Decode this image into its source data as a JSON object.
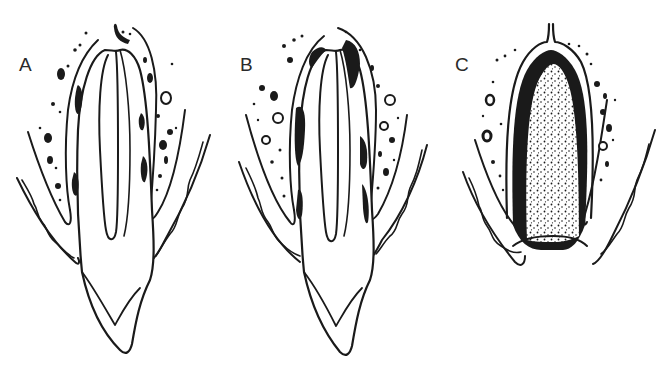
{
  "figure": {
    "panels": [
      {
        "id": "A",
        "label": "A",
        "content": "tooth root with pulp canal in socket; scattered dark deposits along root surface"
      },
      {
        "id": "B",
        "label": "B",
        "content": "tooth root with pulp canal in socket; heavier dark deposits along root surface"
      },
      {
        "id": "C",
        "label": "C",
        "content": "empty socket filled with stippled (granular) material lined by dark layer"
      }
    ]
  },
  "colors": {
    "ink": "#1a1a1a",
    "label": "#2a2a2a",
    "background": "#ffffff"
  }
}
